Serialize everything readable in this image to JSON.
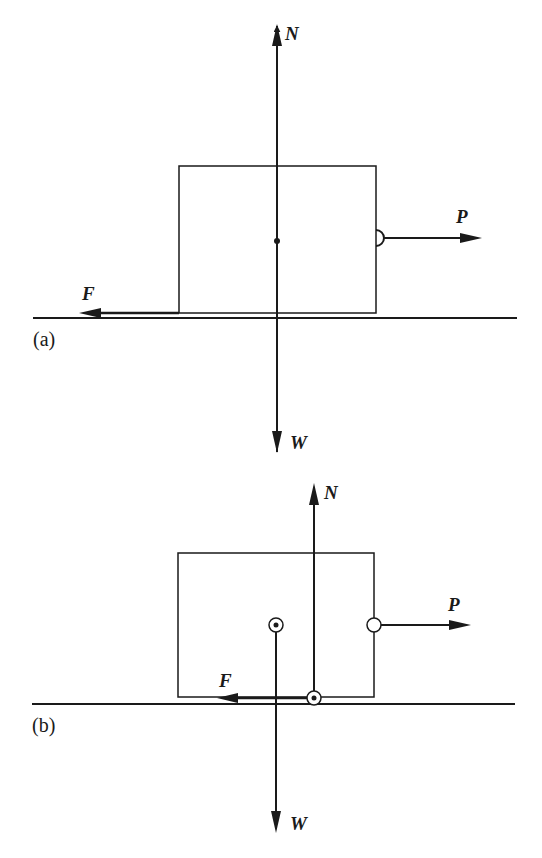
{
  "colors": {
    "ink": "#1a1a1a",
    "background": "#ffffff"
  },
  "panel_a": {
    "caption": "(a)",
    "labels": {
      "normal": "N",
      "weight": "W",
      "push": "P",
      "friction": "F"
    },
    "description": "Free-body diagram: block on ground with N and W acting through the center point, P applied at the right face, F at the bottom-left edge"
  },
  "panel_b": {
    "caption": "(b)",
    "labels": {
      "normal": "N",
      "weight": "W",
      "push": "P",
      "friction": "F"
    },
    "description": "Free-body diagram: W through center of mass, N offset to the right acting at the contact point, P applied at the right face, F along the bottom"
  }
}
